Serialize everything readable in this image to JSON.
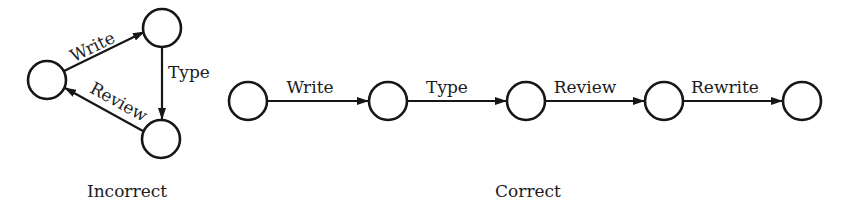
{
  "colors": {
    "background": "#ffffff",
    "ink": "#161616"
  },
  "incorrect": {
    "caption": "Incorrect",
    "nodes": [
      {
        "id": "left",
        "cx": 47,
        "cy": 80,
        "r": 19
      },
      {
        "id": "top",
        "cx": 162,
        "cy": 28,
        "r": 19
      },
      {
        "id": "bottom",
        "cx": 161,
        "cy": 139,
        "r": 19
      }
    ],
    "edges": [
      {
        "from": "left",
        "to": "top",
        "label": "Write"
      },
      {
        "from": "top",
        "to": "bottom",
        "label": "Type"
      },
      {
        "from": "bottom",
        "to": "left",
        "label": "Review"
      }
    ]
  },
  "correct": {
    "caption": "Correct",
    "nodes": [
      {
        "id": "n1",
        "cx": 248,
        "cy": 101,
        "r": 19
      },
      {
        "id": "n2",
        "cx": 388,
        "cy": 101,
        "r": 19
      },
      {
        "id": "n3",
        "cx": 526,
        "cy": 101,
        "r": 19
      },
      {
        "id": "n4",
        "cx": 664,
        "cy": 101,
        "r": 19
      },
      {
        "id": "n5",
        "cx": 802,
        "cy": 101,
        "r": 19
      }
    ],
    "edges": [
      {
        "from": "n1",
        "to": "n2",
        "label": "Write"
      },
      {
        "from": "n2",
        "to": "n3",
        "label": "Type"
      },
      {
        "from": "n3",
        "to": "n4",
        "label": "Review"
      },
      {
        "from": "n4",
        "to": "n5",
        "label": "Rewrite"
      }
    ]
  }
}
